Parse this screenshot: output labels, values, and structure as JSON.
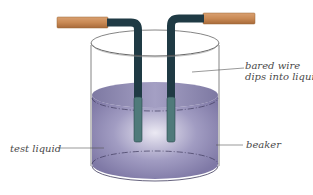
{
  "diagram": {
    "labels": {
      "bared_wire_line1": "bared wire",
      "bared_wire_line2": "dips into liquid",
      "test_liquid": "test liquid",
      "beaker": "beaker"
    },
    "colors": {
      "insulation": "#c98a55",
      "bare_wire": "#1f3a44",
      "wire_submerged": "#4f7a7a",
      "liquid": "#8c86b0",
      "liquid_highlight": "#e6e4f0",
      "beaker_outline": "#555555",
      "leader_line": "#555555"
    }
  }
}
